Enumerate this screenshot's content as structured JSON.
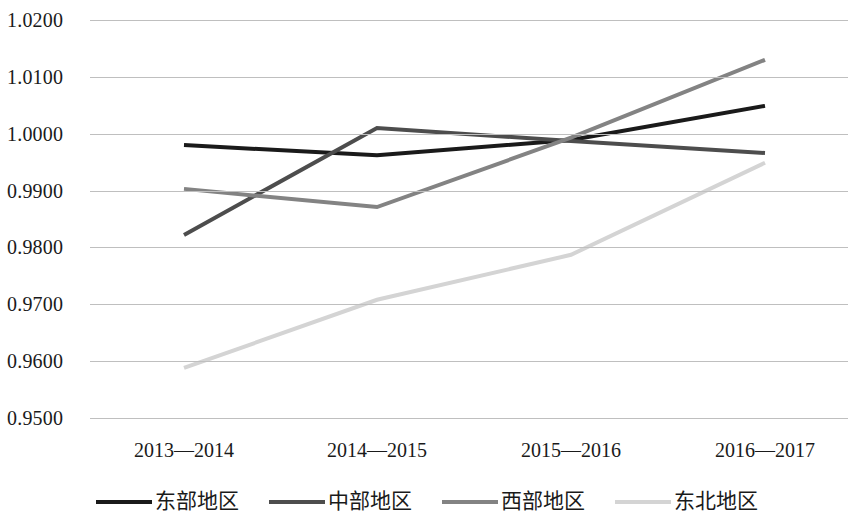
{
  "chart_data": {
    "type": "line",
    "title": "",
    "subtitle": "",
    "xlabel": "",
    "ylabel": "",
    "categories": [
      "2013—2014",
      "2014—2015",
      "2015—2016",
      "2016—2017"
    ],
    "ylim": [
      0.95,
      1.02
    ],
    "ytick_labels": [
      "1.0200",
      "1.0100",
      "1.0000",
      "0.9900",
      "0.9800",
      "0.9700",
      "0.9600",
      "0.9500"
    ],
    "ytick_values": [
      1.02,
      1.01,
      1.0,
      0.99,
      0.98,
      0.97,
      0.96,
      0.95
    ],
    "grid": true,
    "grid_color": "#bfbfbf",
    "legend_position": "bottom",
    "series": [
      {
        "name": "东部地区",
        "color": "#1a1a1a",
        "values": [
          0.998,
          0.9962,
          0.9989,
          1.0049
        ]
      },
      {
        "name": "中部地区",
        "color": "#4d4d4d",
        "values": [
          0.9822,
          1.001,
          0.9987,
          0.9966
        ]
      },
      {
        "name": "西部地区",
        "color": "#838383",
        "values": [
          0.9903,
          0.9871,
          0.9993,
          1.013
        ]
      },
      {
        "name": "东北地区",
        "color": "#d4d4d4",
        "values": [
          0.9588,
          0.9708,
          0.9787,
          0.9949
        ]
      }
    ]
  }
}
